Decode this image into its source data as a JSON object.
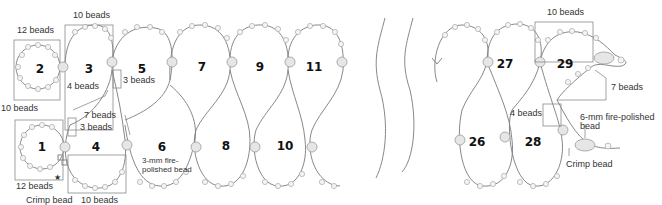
{
  "diagram": {
    "loop_numbers": [
      "1",
      "2",
      "3",
      "4",
      "5",
      "6",
      "7",
      "8",
      "9",
      "10",
      "11",
      "26",
      "27",
      "28",
      "29"
    ],
    "labels": {
      "top_10": "10 beads",
      "loop2_12": "12 beads",
      "left_10": "10 beads",
      "four_beads_a": "4 beads",
      "three_beads_a": "3 beads",
      "seven_beads_a": "7 beads",
      "three_beads_b": "3 beads",
      "loop1_12": "12 beads",
      "crimp_a": "Crimp bead",
      "bottom_10": "10 beads",
      "fp3_line1": "3-mm fire-",
      "fp3_line2": "polished bead",
      "r_top_10": "10 beads",
      "r_seven": "7 beads",
      "r_four": "4 beads",
      "fp6_line1": "6-mm fire-polished",
      "fp6_line2": "bead",
      "crimp_b": "Crimp bead",
      "star": "★"
    }
  }
}
